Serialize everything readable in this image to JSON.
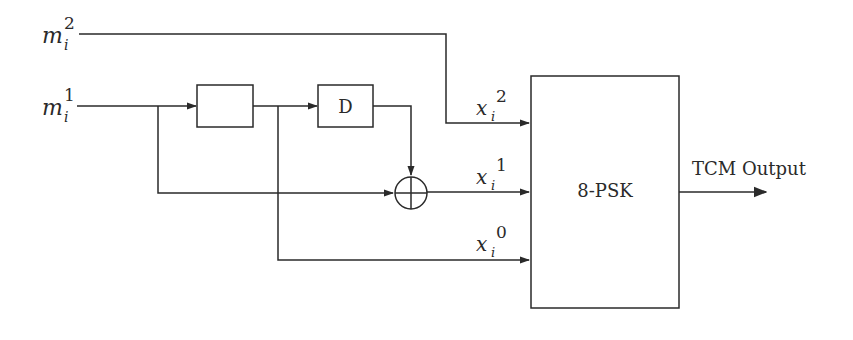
{
  "diagram": {
    "colors": {
      "stroke": "#2a2a2a",
      "background": "#ffffff"
    },
    "inputs": {
      "m2": {
        "base": "m",
        "sub": "i",
        "sup": "2"
      },
      "m1": {
        "base": "m",
        "sub": "i",
        "sup": "1"
      }
    },
    "blocks": {
      "delay1": {
        "label": ""
      },
      "delay2": {
        "label": "D"
      },
      "xor": {
        "symbol": "⊕",
        "name": "modulo-2 adder"
      },
      "mapper": {
        "label": "8-PSK"
      }
    },
    "coded_bits": {
      "x2": {
        "base": "x",
        "sub": "i",
        "sup": "2"
      },
      "x1": {
        "base": "x",
        "sub": "i",
        "sup": "1"
      },
      "x0": {
        "base": "x",
        "sub": "i",
        "sup": "0"
      }
    },
    "output": {
      "label": "TCM Output"
    }
  }
}
